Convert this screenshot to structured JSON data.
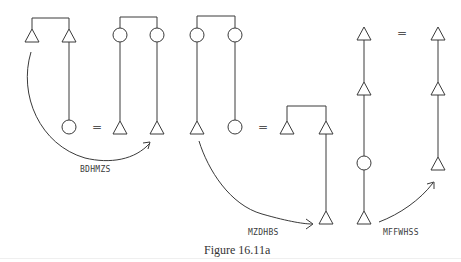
{
  "figure": {
    "caption": "Figure 16.11a",
    "equals_sign": "=",
    "labels": {
      "arrow1": "BDHMZS",
      "arrow2": "MZDHBS",
      "arrow3": "MFFWHSS"
    },
    "diagrams": [
      {
        "id": 1,
        "top": [
          "triangle",
          "triangle"
        ],
        "bottom_right": "circle"
      },
      {
        "id": 2,
        "top": [
          "circle",
          "circle"
        ],
        "bottom": [
          "triangle",
          "triangle"
        ]
      },
      {
        "id": 3,
        "top": [
          "circle",
          "circle"
        ],
        "bottom": [
          "triangle",
          "circle"
        ]
      },
      {
        "id": 4,
        "top": [
          "triangle",
          "triangle"
        ],
        "bottom_right": "triangle"
      },
      {
        "id": 5,
        "chain": [
          "triangle",
          "triangle",
          "circle",
          "triangle"
        ]
      },
      {
        "id": 6,
        "chain": [
          "triangle",
          "triangle",
          "triangle"
        ]
      }
    ]
  }
}
